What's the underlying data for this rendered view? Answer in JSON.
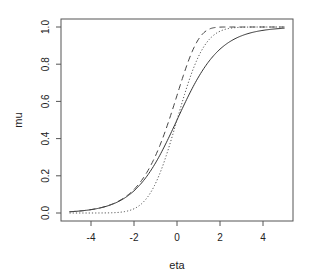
{
  "chart_data": {
    "type": "line",
    "title": "",
    "xlabel": "eta",
    "ylabel": "mu",
    "xlim": [
      -5,
      5
    ],
    "ylim": [
      0,
      1
    ],
    "grid": false,
    "legend": null,
    "x_ticks": [
      -4,
      -2,
      0,
      2,
      4
    ],
    "x_tick_labels": [
      "-4",
      "-2",
      "0",
      "2",
      "4"
    ],
    "y_ticks": [
      0.0,
      0.2,
      0.4,
      0.6,
      0.8,
      1.0
    ],
    "y_tick_labels": [
      "0.0",
      "0.2",
      "0.4",
      "0.6",
      "0.8",
      "1.0"
    ],
    "x": [
      -5,
      -4.5,
      -4,
      -3.5,
      -3,
      -2.5,
      -2,
      -1.5,
      -1,
      -0.5,
      0,
      0.5,
      1,
      1.5,
      2,
      2.5,
      3,
      3.5,
      4,
      4.5,
      5
    ],
    "series": [
      {
        "name": "logit",
        "style": "solid",
        "color": "#333333",
        "values": [
          0.0067,
          0.011,
          0.018,
          0.0293,
          0.0474,
          0.0759,
          0.1192,
          0.1824,
          0.2689,
          0.3775,
          0.5,
          0.6225,
          0.7311,
          0.8176,
          0.8808,
          0.9241,
          0.9526,
          0.9707,
          0.982,
          0.989,
          0.9933
        ]
      },
      {
        "name": "probit",
        "style": "dotted",
        "color": "#555555",
        "values": [
          0.0,
          0.0,
          3e-05,
          0.0002,
          0.0013,
          0.0062,
          0.0228,
          0.0668,
          0.1587,
          0.3085,
          0.5,
          0.6915,
          0.8413,
          0.9332,
          0.9772,
          0.9938,
          0.9987,
          0.9998,
          1.0,
          1.0,
          1.0
        ]
      },
      {
        "name": "cloglog",
        "style": "dashed",
        "color": "#444444",
        "values": [
          0.0067,
          0.011,
          0.0181,
          0.0297,
          0.0486,
          0.0788,
          0.1266,
          0.2,
          0.3078,
          0.4548,
          0.6321,
          0.8077,
          0.934,
          0.9887,
          0.9994,
          1.0,
          1.0,
          1.0,
          1.0,
          1.0,
          1.0
        ]
      }
    ]
  },
  "layout": {
    "plot_left": 61,
    "plot_right": 293,
    "plot_top": 19,
    "plot_bottom": 221,
    "x0_px": 177,
    "px_per_x": 21.5,
    "y0_px": 213,
    "px_per_y": 186
  }
}
